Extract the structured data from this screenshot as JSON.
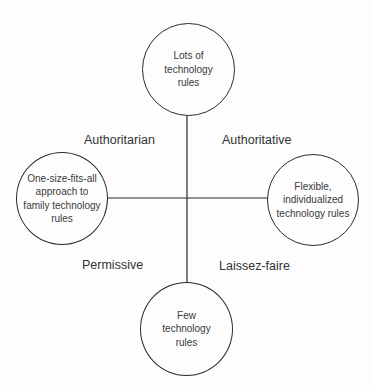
{
  "diagram": {
    "type": "quadrant-axes",
    "axes": {
      "vertical": {
        "top": "Lots of\ntechnology\nrules",
        "bottom": "Few\ntechnology\nrules"
      },
      "horizontal": {
        "left": "One-size-fits-all\napproach to\nfamily technology\nrules",
        "right": "Flexible,\nindividualized\ntechnology rules"
      }
    },
    "quadrants": {
      "top_left": "Authoritarian",
      "top_right": "Authoritative",
      "bottom_left": "Permissive",
      "bottom_right": "Laissez-faire"
    },
    "colors": {
      "line": "#2b2b2b",
      "background": "#fdfdfd",
      "text": "#333333"
    }
  }
}
